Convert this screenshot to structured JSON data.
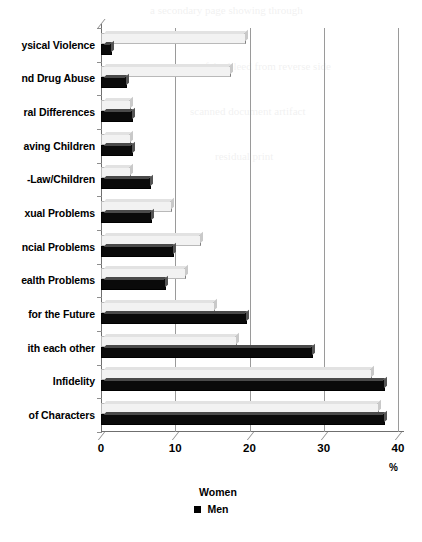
{
  "chart_data": {
    "type": "bar",
    "orientation": "horizontal",
    "title": "",
    "xlabel": "%",
    "ylabel": "",
    "xlim": [
      0,
      40
    ],
    "xticks": [
      "0",
      "10",
      "20",
      "30",
      "40"
    ],
    "grid": true,
    "legend_position": "bottom-center",
    "categories": [
      "ysical Violence",
      "nd Drug Abuse",
      "ral Differences",
      "aving Children",
      "-Law/Children",
      "xual Problems",
      "ncial Problems",
      "ealth Problems",
      "for the Future",
      "ith each other",
      "Infidelity",
      "of Characters"
    ],
    "series": [
      {
        "name": "Women",
        "values": [
          19.5,
          17.5,
          4.0,
          4.0,
          4.0,
          9.5,
          13.5,
          11.5,
          15.3,
          18.3,
          36.5,
          37.5
        ]
      },
      {
        "name": "Men",
        "values": [
          1.5,
          3.5,
          4.3,
          4.3,
          6.8,
          6.9,
          9.8,
          8.8,
          19.7,
          28.5,
          38.3,
          38.3
        ]
      }
    ]
  },
  "legend": {
    "women_label": "Women",
    "men_label": "Men"
  },
  "axis": {
    "unit_label": "%"
  },
  "colors": {
    "women_fill": "#f2f2f2",
    "men_fill": "#0a0a0a",
    "gridline": "#9a9a9a",
    "axis": "#6f6f6f"
  },
  "ghost_text": {
    "g1": "a secondary page showing through",
    "g2": "faint bleed from reverse side",
    "g3": "scanned document artifact",
    "g4": "residual print"
  }
}
